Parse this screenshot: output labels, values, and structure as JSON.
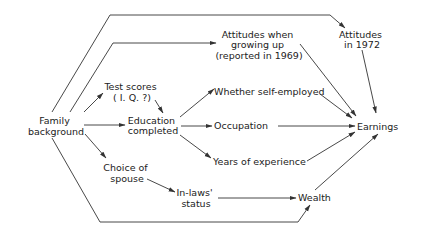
{
  "nodes": {
    "family": [
      "Family",
      "background"
    ],
    "test": [
      "Test scores",
      "( I. Q. ?)"
    ],
    "education": [
      "Education",
      "completed"
    ],
    "spouse": [
      "Choice of",
      "spouse"
    ],
    "inlaws": [
      "In-laws'",
      "status"
    ],
    "attitudes_growing": [
      "Attitudes when",
      "growing up",
      "(reported in 1969)"
    ],
    "attitudes_1972": [
      "Attitudes",
      "in 1972"
    ],
    "self_employed": [
      "Whether self-employed"
    ],
    "occupation": [
      "Occupation"
    ],
    "experience": [
      "Years of experience"
    ],
    "earnings": [
      "Earnings"
    ],
    "wealth": [
      "Wealth"
    ]
  },
  "edges": [
    {
      "from": "family",
      "to": "attitudes_1972"
    },
    {
      "from": "family",
      "to": "attitudes_growing"
    },
    {
      "from": "family",
      "to": "test"
    },
    {
      "from": "family",
      "to": "education"
    },
    {
      "from": "family",
      "to": "spouse"
    },
    {
      "from": "family",
      "to": "wealth"
    },
    {
      "from": "test",
      "to": "education"
    },
    {
      "from": "education",
      "to": "self_employed"
    },
    {
      "from": "education",
      "to": "occupation"
    },
    {
      "from": "education",
      "to": "experience"
    },
    {
      "from": "spouse",
      "to": "inlaws"
    },
    {
      "from": "inlaws",
      "to": "wealth"
    },
    {
      "from": "attitudes_growing",
      "to": "earnings"
    },
    {
      "from": "attitudes_1972",
      "to": "earnings"
    },
    {
      "from": "self_employed",
      "to": "earnings"
    },
    {
      "from": "occupation",
      "to": "earnings"
    },
    {
      "from": "experience",
      "to": "earnings"
    },
    {
      "from": "wealth",
      "to": "earnings"
    }
  ]
}
